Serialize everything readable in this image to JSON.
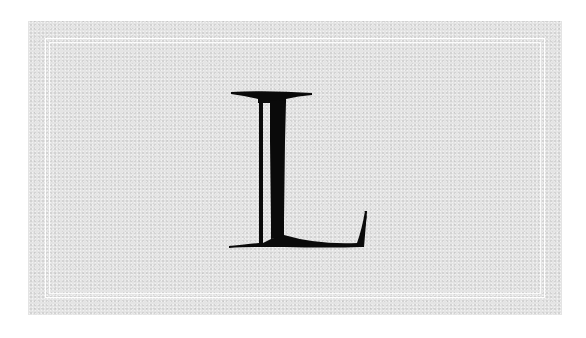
{
  "card": {
    "letter": "L",
    "paper_color": "#e4e4e4",
    "frame_color": "#ffffff",
    "ink_color": "#0a0a0a"
  }
}
